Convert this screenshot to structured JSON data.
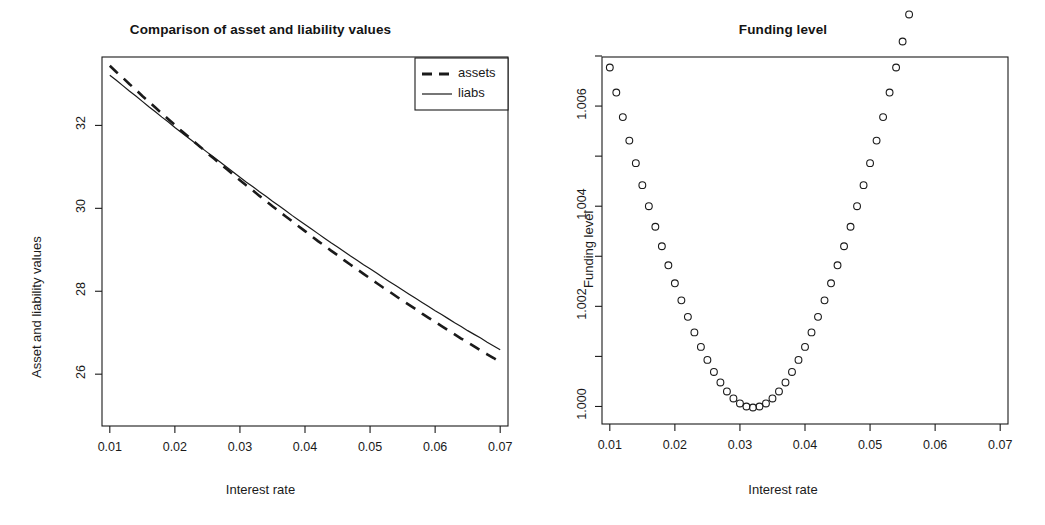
{
  "figure": {
    "width": 1045,
    "height": 525,
    "background": "#ffffff",
    "ink_color": "#1a1a1a"
  },
  "panels": {
    "left": {
      "title": "Comparison of asset and liability values",
      "xlabel": "Interest rate",
      "ylabel": "Asset and liability values",
      "xticks": [
        "0.01",
        "0.02",
        "0.03",
        "0.04",
        "0.05",
        "0.06",
        "0.07"
      ],
      "yticks": [
        "26",
        "28",
        "30",
        "32"
      ],
      "legend": {
        "items": [
          {
            "label": "assets",
            "style": "dashed"
          },
          {
            "label": "liabs",
            "style": "solid"
          }
        ]
      }
    },
    "right": {
      "title": "Funding level",
      "xlabel": "Interest rate",
      "ylabel": "Funding level",
      "xticks": [
        "0.01",
        "0.02",
        "0.03",
        "0.04",
        "0.05",
        "0.06",
        "0.07"
      ],
      "yticks": [
        "1.000",
        "1.002",
        "1.004",
        "1.006"
      ]
    }
  },
  "chart_data": [
    {
      "id": "asset-liability-comparison",
      "type": "line",
      "title": "Comparison of asset and liability values",
      "xlabel": "Interest rate",
      "ylabel": "Asset and liability values",
      "xlim": [
        0.0088,
        0.0712
      ],
      "ylim": [
        24.75,
        33.65
      ],
      "xticks": [
        0.01,
        0.02,
        0.03,
        0.04,
        0.05,
        0.06,
        0.07
      ],
      "yticks": [
        26,
        28,
        30,
        32
      ],
      "grid": false,
      "legend_position": "top-right",
      "x": [
        0.01,
        0.011,
        0.012,
        0.013,
        0.014,
        0.015,
        0.016,
        0.017,
        0.018,
        0.019,
        0.02,
        0.021,
        0.022,
        0.023,
        0.024,
        0.025,
        0.026,
        0.027,
        0.028,
        0.029,
        0.03,
        0.031,
        0.032,
        0.033,
        0.034,
        0.035,
        0.036,
        0.037,
        0.038,
        0.039,
        0.04,
        0.041,
        0.042,
        0.043,
        0.044,
        0.045,
        0.046,
        0.047,
        0.048,
        0.049,
        0.05,
        0.051,
        0.052,
        0.053,
        0.054,
        0.055,
        0.056,
        0.057,
        0.058,
        0.059,
        0.06,
        0.061,
        0.062,
        0.063,
        0.064,
        0.065,
        0.066,
        0.067,
        0.068,
        0.069,
        0.07
      ],
      "series": [
        {
          "name": "assets",
          "style": "dashed",
          "color": "#1a1a1a",
          "values": [
            33.44,
            33.29,
            33.15,
            33.0,
            32.86,
            32.71,
            32.57,
            32.43,
            32.29,
            32.15,
            32.01,
            31.87,
            31.74,
            31.6,
            31.47,
            31.33,
            31.2,
            31.07,
            30.94,
            30.81,
            30.68,
            30.55,
            30.43,
            30.3,
            30.18,
            30.05,
            29.93,
            29.81,
            29.69,
            29.57,
            29.45,
            29.33,
            29.21,
            29.1,
            28.98,
            28.87,
            28.75,
            28.64,
            28.53,
            28.42,
            28.31,
            28.2,
            28.09,
            27.99,
            27.88,
            27.77,
            27.67,
            27.57,
            27.46,
            27.36,
            27.26,
            27.16,
            27.06,
            26.96,
            26.86,
            26.77,
            26.67,
            26.57,
            26.48,
            26.39,
            26.29
          ]
        },
        {
          "name": "liabs",
          "style": "solid",
          "color": "#1a1a1a",
          "values": [
            33.21,
            33.09,
            32.96,
            32.83,
            32.71,
            32.58,
            32.45,
            32.33,
            32.2,
            32.08,
            31.95,
            31.83,
            31.71,
            31.59,
            31.47,
            31.35,
            31.23,
            31.11,
            30.99,
            30.87,
            30.75,
            30.63,
            30.52,
            30.4,
            30.29,
            30.17,
            30.06,
            29.95,
            29.83,
            29.72,
            29.61,
            29.5,
            29.39,
            29.28,
            29.17,
            29.07,
            28.96,
            28.85,
            28.75,
            28.64,
            28.54,
            28.44,
            28.33,
            28.23,
            28.13,
            28.03,
            27.93,
            27.83,
            27.73,
            27.63,
            27.53,
            27.44,
            27.34,
            27.24,
            27.15,
            27.05,
            26.96,
            26.87,
            26.77,
            26.68,
            26.59
          ]
        }
      ]
    },
    {
      "id": "funding-level",
      "type": "scatter",
      "title": "Funding level",
      "xlabel": "Interest rate",
      "ylabel": "Funding level",
      "xlim": [
        0.0088,
        0.0712
      ],
      "ylim": [
        0.99965,
        1.00698
      ],
      "xticks": [
        0.01,
        0.02,
        0.03,
        0.04,
        0.05,
        0.06,
        0.07
      ],
      "yticks": [
        1.0,
        1.002,
        1.004,
        1.006
      ],
      "minor_yticks": [
        1.001,
        1.003,
        1.005,
        1.007
      ],
      "grid": false,
      "marker": "open-circle",
      "marker_color": "#1a1a1a",
      "x": [
        0.01,
        0.011,
        0.012,
        0.013,
        0.014,
        0.015,
        0.016,
        0.017,
        0.018,
        0.019,
        0.02,
        0.021,
        0.022,
        0.023,
        0.024,
        0.025,
        0.026,
        0.027,
        0.028,
        0.029,
        0.03,
        0.031,
        0.032,
        0.033,
        0.034,
        0.035,
        0.036,
        0.037,
        0.038,
        0.039,
        0.04,
        0.041,
        0.042,
        0.043,
        0.044,
        0.045,
        0.046,
        0.047,
        0.048,
        0.049,
        0.05,
        0.051,
        0.052,
        0.053,
        0.054,
        0.055,
        0.056,
        0.057,
        0.058,
        0.059,
        0.06,
        0.061,
        0.062,
        0.063,
        0.064,
        0.065,
        0.066,
        0.067,
        0.068,
        0.069,
        0.07
      ],
      "y": [
        1.00677,
        1.00627,
        1.00578,
        1.00531,
        1.00486,
        1.00442,
        1.004,
        1.00359,
        1.0032,
        1.00282,
        1.00246,
        1.00212,
        1.00179,
        1.00148,
        1.00119,
        1.00093,
        1.00069,
        1.00048,
        1.0003,
        1.00016,
        1.00006,
        1.0,
        0.99998,
        1.0,
        1.00006,
        1.00016,
        1.0003,
        1.00048,
        1.00069,
        1.00093,
        1.00119,
        1.00148,
        1.00179,
        1.00212,
        1.00246,
        1.00282,
        1.0032,
        1.00359,
        1.004,
        1.00442,
        1.00486,
        1.00531,
        1.00578,
        1.00627,
        1.00677,
        1.00729,
        1.00783,
        1.00838,
        1.00895,
        1.00953,
        1.01013,
        1.01075,
        1.01139,
        1.01204,
        1.01271,
        1.0134,
        1.01411,
        1.01483,
        1.01557,
        1.01633,
        1.01711
      ]
    }
  ]
}
